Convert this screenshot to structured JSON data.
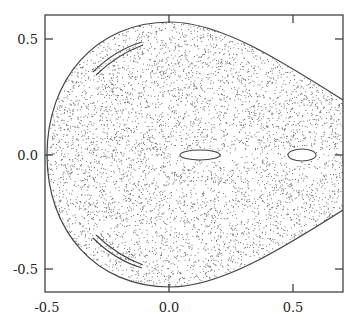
{
  "chart_data": {
    "type": "scatter",
    "title": "",
    "xlabel": "",
    "ylabel": "",
    "xlim": [
      -0.5,
      0.7
    ],
    "ylim": [
      -0.6,
      0.6
    ],
    "grid": false,
    "legend": null,
    "x_ticks": [
      {
        "value": -0.5,
        "label": "-0.5"
      },
      {
        "value": 0.0,
        "label": "0.0"
      },
      {
        "value": 0.5,
        "label": "0.5"
      }
    ],
    "y_ticks": [
      {
        "value": 0.5,
        "label": "0.5"
      },
      {
        "value": 0.0,
        "label": "0.0"
      },
      {
        "value": -0.5,
        "label": "-0.5"
      }
    ],
    "boundary": {
      "left_x": -0.5,
      "top_y": 0.57,
      "bottom_y": -0.57,
      "apex_x": 0.05,
      "right_exit_y_top": 0.19,
      "right_exit_y_bottom": -0.19
    },
    "islands": [
      {
        "type": "ellipse",
        "cx": 0.13,
        "cy": 0.0,
        "rx": 0.08,
        "ry": 0.025
      },
      {
        "type": "ellipse",
        "cx": 0.535,
        "cy": 0.0,
        "rx": 0.055,
        "ry": 0.03
      },
      {
        "type": "arc",
        "from": [
          -0.38,
          0.37
        ],
        "to": [
          -0.18,
          0.49
        ]
      },
      {
        "type": "arc",
        "from": [
          -0.38,
          -0.37
        ],
        "to": [
          -0.18,
          -0.49
        ]
      }
    ],
    "colors": {
      "dots": "#555555",
      "curves": "#444444",
      "frame": "#333333"
    }
  }
}
